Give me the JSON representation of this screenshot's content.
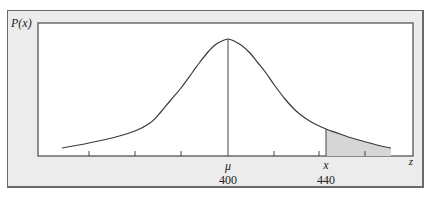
{
  "chart_data": {
    "type": "area",
    "title": "",
    "ylabel": "P(x)",
    "xlabel": "z",
    "x_labels": [
      {
        "symbol": "μ",
        "value": "400",
        "position": "center"
      },
      {
        "symbol": "x",
        "value": "440",
        "position": "right of center"
      }
    ],
    "mean": 400,
    "shaded_from": 440,
    "shaded_region": "right tail (x ≥ 440)",
    "ticks_count": 7,
    "grid": false,
    "legend": "none",
    "curve_points_px": [
      [
        62,
        148
      ],
      [
        89,
        143
      ],
      [
        112,
        138
      ],
      [
        135,
        131
      ],
      [
        150,
        123
      ],
      [
        160,
        113
      ],
      [
        170,
        101
      ],
      [
        181,
        88
      ],
      [
        192,
        73
      ],
      [
        200,
        62
      ],
      [
        208,
        52
      ],
      [
        215,
        45
      ],
      [
        222,
        41
      ],
      [
        228,
        39
      ],
      [
        234,
        41
      ],
      [
        241,
        45
      ],
      [
        250,
        53
      ],
      [
        258,
        63
      ],
      [
        266,
        73
      ],
      [
        275,
        86
      ],
      [
        285,
        99
      ],
      [
        295,
        110
      ],
      [
        305,
        118
      ],
      [
        315,
        124
      ],
      [
        326,
        129
      ],
      [
        340,
        134
      ],
      [
        355,
        139
      ],
      [
        370,
        143
      ],
      [
        381,
        146
      ],
      [
        391,
        148
      ]
    ]
  },
  "labels": {
    "y_axis": "P(x)",
    "x_axis_end": "z",
    "mu_symbol": "μ",
    "mu_value": "400",
    "x_symbol": "x",
    "x_value": "440"
  },
  "colors": {
    "panel_bg": "#ececec",
    "plot_bg": "#ffffff",
    "line": "#3a3a3a",
    "shade": "#d6d6d6",
    "border": "#6a6a6a"
  }
}
